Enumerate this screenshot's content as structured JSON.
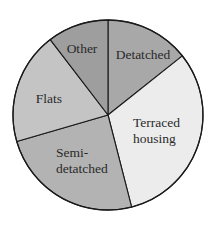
{
  "chart_data": {
    "type": "pie",
    "title": "",
    "start_angle_deg": 0,
    "direction": "clockwise",
    "categories": [
      "Detatched",
      "Terraced housing",
      "Semi-detatched",
      "Flats",
      "Other"
    ],
    "values": [
      14.3,
      31.7,
      24.5,
      19.1,
      10.4
    ],
    "unit": "percent (estimated from slice angles)",
    "slices": [
      {
        "name": "Detatched",
        "label_lines": [
          "Detatched"
        ],
        "percent": 14.3,
        "color": "#a8a8a8",
        "label_pos": [
          143,
          59
        ]
      },
      {
        "name": "Terraced housing",
        "label_lines": [
          "Terraced",
          "housing"
        ],
        "percent": 31.7,
        "color": "#ececec",
        "label_pos": [
          157,
          127
        ]
      },
      {
        "name": "Semi-detatched",
        "label_lines": [
          "Semi-",
          "detatched"
        ],
        "percent": 24.5,
        "color": "#b3b3b3",
        "label_pos": [
          56,
          157
        ]
      },
      {
        "name": "Flats",
        "label_lines": [
          "Flats"
        ],
        "percent": 19.1,
        "color": "#c4c4c4",
        "label_pos": [
          49,
          103
        ]
      },
      {
        "name": "Other",
        "label_lines": [
          "Other"
        ],
        "percent": 10.4,
        "color": "#9e9e9e",
        "label_pos": [
          82,
          53
        ]
      }
    ],
    "legend": "none (labels inside slices)",
    "geometry": {
      "cx": 108,
      "cy": 115,
      "r": 95
    }
  }
}
